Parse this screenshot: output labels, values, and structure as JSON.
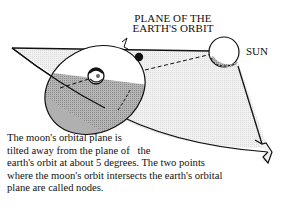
{
  "diagram": {
    "title_lines": [
      "PLANE OF THE",
      "EARTH'S ORBIT"
    ],
    "labels": {
      "sun": "SUN"
    },
    "caption_lines": [
      "The moon's orbital plane is",
      "tilted away from the plane of   the",
      "earth's orbit at about 5 degrees. The two points",
      "where the moon's orbit intersects the earth's orbital",
      "plane are called nodes."
    ],
    "elements": [
      "earth-orbital-plane",
      "moon-orbital-plane",
      "earth",
      "moon",
      "sun",
      "sun-earth-line",
      "orbit-direction-arrow"
    ],
    "colors": {
      "plane_fill": "#ececec",
      "shadow_fill": "#a8a8a8",
      "dark_shade": "#7d7d7d",
      "stroke": "#111111"
    },
    "inclination_degrees": 5
  }
}
